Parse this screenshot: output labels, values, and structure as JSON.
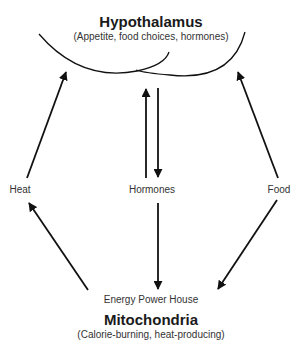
{
  "top": {
    "title": "Hypothalamus",
    "subtitle": "(Appetite, food choices, hormones)"
  },
  "bottom": {
    "caption": "Energy Power House",
    "title": "Mitochondria",
    "subtitle": "(Calorie-burning, heat-producing)"
  },
  "nodes": {
    "left": "Heat",
    "center": "Hormones",
    "right": "Food"
  },
  "edges": [
    {
      "from": "Heat",
      "to": "Hypothalamus"
    },
    {
      "from": "Hormones",
      "to": "Hypothalamus"
    },
    {
      "from": "Hypothalamus",
      "to": "Hormones"
    },
    {
      "from": "Food",
      "to": "Hypothalamus"
    },
    {
      "from": "Mitochondria",
      "to": "Heat"
    },
    {
      "from": "Hormones",
      "to": "Mitochondria"
    },
    {
      "from": "Food",
      "to": "Mitochondria"
    }
  ],
  "colors": {
    "line": "#111111",
    "text": "#222222"
  }
}
